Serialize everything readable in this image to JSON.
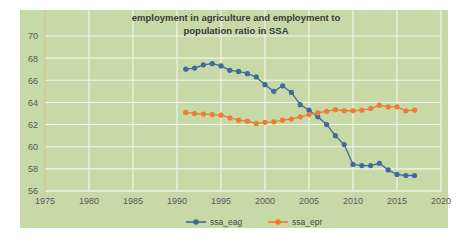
{
  "chart_data": {
    "type": "line",
    "title": "employment in agriculture and employment to population ratio in SSA",
    "title_line1": "employment in agriculture and employment to",
    "title_line2": "population ratio in SSA",
    "xlabel": "",
    "ylabel": "",
    "xlim": [
      1975,
      2020
    ],
    "ylim": [
      56,
      70
    ],
    "xticks": [
      1975,
      1980,
      1985,
      1990,
      1995,
      2000,
      2005,
      2010,
      2015,
      2020
    ],
    "yticks": [
      56,
      58,
      60,
      62,
      64,
      66,
      68,
      70
    ],
    "grid": true,
    "legend_position": "bottom",
    "plot_background": "#c7d9a7",
    "x": [
      1991,
      1992,
      1993,
      1994,
      1995,
      1996,
      1997,
      1998,
      1999,
      2000,
      2001,
      2002,
      2003,
      2004,
      2005,
      2006,
      2007,
      2008,
      2009,
      2010,
      2011,
      2012,
      2013,
      2014,
      2015,
      2016,
      2017
    ],
    "series": [
      {
        "name": "ssa_eag",
        "color": "#41699f",
        "values": [
          67.0,
          67.1,
          67.4,
          67.5,
          67.3,
          66.9,
          66.8,
          66.6,
          66.3,
          65.6,
          65.0,
          65.5,
          64.9,
          63.8,
          63.3,
          62.7,
          62.0,
          61.0,
          60.2,
          58.4,
          58.3,
          58.3,
          58.5,
          57.9,
          57.5,
          57.4,
          57.4
        ]
      },
      {
        "name": "ssa_epr",
        "color": "#ed7d31",
        "values": [
          63.1,
          63.0,
          62.95,
          62.9,
          62.85,
          62.6,
          62.4,
          62.3,
          62.1,
          62.2,
          62.25,
          62.4,
          62.5,
          62.7,
          62.9,
          63.05,
          63.2,
          63.35,
          63.25,
          63.25,
          63.3,
          63.45,
          63.75,
          63.6,
          63.6,
          63.25,
          63.3
        ]
      }
    ],
    "legend": [
      {
        "label": "ssa_eag",
        "color": "#41699f"
      },
      {
        "label": "ssa_epr",
        "color": "#ed7d31"
      }
    ]
  }
}
